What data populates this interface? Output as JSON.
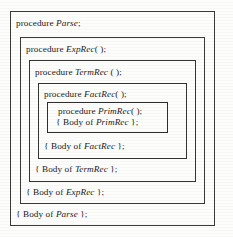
{
  "figure": {
    "line_color": "#3a3a3a",
    "text_color": "#1b1b1b",
    "background": "#fdfdfc",
    "keyword": "procedure",
    "body_prefix": "{ Body of",
    "body_suffix": "};"
  },
  "levels": [
    {
      "id": "parse",
      "depth": 0,
      "name": "Parse",
      "declaration_prefix": "procedure ",
      "declaration_suffix": ";",
      "body_prefix": "{ Body of ",
      "body_suffix": " };"
    },
    {
      "id": "exprec",
      "depth": 1,
      "name": "ExpRec",
      "declaration_prefix": "procedure ",
      "declaration_suffix": "( );",
      "body_prefix": "{ Body of ",
      "body_suffix": " };"
    },
    {
      "id": "termrec",
      "depth": 2,
      "name": "TermRec",
      "declaration_prefix": "procedure ",
      "declaration_suffix": " ( );",
      "body_prefix": "{ Body of ",
      "body_suffix": " };"
    },
    {
      "id": "factrec",
      "depth": 3,
      "name": "FactRec",
      "declaration_prefix": "procedure ",
      "declaration_suffix": "( );",
      "body_prefix": "{ Body of ",
      "body_suffix": " };"
    },
    {
      "id": "primrec",
      "depth": 4,
      "name": "PrimRec",
      "declaration_prefix": "procedure ",
      "declaration_suffix": "( );",
      "body_prefix": "{ Body of ",
      "body_suffix": " };"
    }
  ]
}
